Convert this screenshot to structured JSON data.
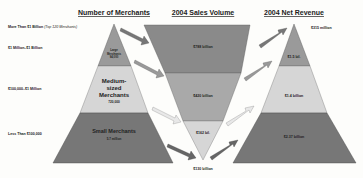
{
  "titles": {
    "merchants": "Number of Merchants",
    "sales": "2004 Sales Volume",
    "revenue": "2004 Net Revenue"
  },
  "tiers": [
    {
      "label": "More Than $1 Billion",
      "note": "(Top 120 Merchants)"
    },
    {
      "label": "$1 Million–$1 Billion"
    },
    {
      "label": "$100,000–$1 Million"
    },
    {
      "label": "Less Than $100,000"
    }
  ],
  "merchants": {
    "large": {
      "line1": "Large",
      "line2": "Merchants",
      "count": "94,000"
    },
    "medium": {
      "line1": "Medium-",
      "line2": "sized",
      "line3": "Merchants",
      "count": "720,000"
    },
    "small": {
      "line1": "Small Merchants",
      "count": "5.7 million"
    }
  },
  "sales": {
    "top": "$788 billion",
    "large": "$420 billion",
    "medium": "$162 bil.",
    "small": "$130 billion"
  },
  "revenue": {
    "top": "$315 million",
    "large": "$1.5 bil.",
    "medium": "$1.4 billion",
    "small": "$2.37 billion"
  },
  "colors": {
    "dark": "#7a7a7a",
    "mid": "#a8a8a8",
    "light": "#d9d9d9",
    "arrow_dark": "#6e6e6e",
    "arrow_light": "#e6e6e6"
  }
}
